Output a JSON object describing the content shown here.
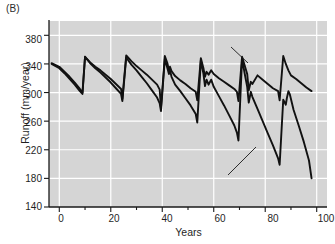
{
  "panel": {
    "label": "(B)"
  },
  "axes": {
    "xlabel": "Years",
    "ylabel": "Runoff (mm/year)",
    "xticks": [
      "0",
      "20",
      "40",
      "60",
      "80",
      "100"
    ],
    "yticks": [
      "380",
      "340",
      "300",
      "260",
      "220",
      "180",
      "140"
    ],
    "xlim": [
      -4,
      104
    ],
    "ylim": [
      140,
      400
    ],
    "grid": true,
    "plot_bg": "#d5d5d5",
    "grid_color": "#ffffff",
    "line_color": "#111111"
  },
  "annotations": [
    {
      "id": "native",
      "lines": [
        "Predicted runoff from",
        "native vegetation"
      ]
    },
    {
      "id": "invasive",
      "lines": [
        "Predicted runoff from",
        "vegetation dominated by",
        "invasive exotic species"
      ]
    }
  ],
  "chart_data": {
    "type": "line",
    "title": "",
    "xlabel": "Years",
    "ylabel": "Runoff (mm/year)",
    "xlim": [
      -4,
      104
    ],
    "ylim": [
      140,
      400
    ],
    "xticks": [
      0,
      20,
      40,
      60,
      80,
      100
    ],
    "yticks": [
      380,
      340,
      300,
      260,
      220,
      180,
      140
    ],
    "grid": true,
    "legend": "annotated-inline",
    "series": [
      {
        "name": "Predicted runoff from native vegetation",
        "color": "#111111",
        "points": [
          [
            -3,
            341
          ],
          [
            0,
            336
          ],
          [
            2,
            329
          ],
          [
            4,
            322
          ],
          [
            6,
            314
          ],
          [
            8,
            305
          ],
          [
            9,
            300
          ],
          [
            10,
            350
          ],
          [
            12,
            342
          ],
          [
            14,
            336
          ],
          [
            16,
            331
          ],
          [
            18,
            325
          ],
          [
            20,
            319
          ],
          [
            22,
            312
          ],
          [
            24,
            305
          ],
          [
            24.5,
            291
          ],
          [
            26,
            352
          ],
          [
            28,
            344
          ],
          [
            30,
            337
          ],
          [
            32,
            331
          ],
          [
            34,
            325
          ],
          [
            36,
            318
          ],
          [
            38,
            311
          ],
          [
            39,
            304
          ],
          [
            39.5,
            278
          ],
          [
            41,
            351
          ],
          [
            42,
            341
          ],
          [
            42.6,
            331
          ],
          [
            43,
            336
          ],
          [
            43.6,
            330
          ],
          [
            45,
            323
          ],
          [
            47,
            317
          ],
          [
            49,
            312
          ],
          [
            51,
            306
          ],
          [
            53,
            301
          ],
          [
            53.6,
            289
          ],
          [
            55,
            348
          ],
          [
            56,
            334
          ],
          [
            56.6,
            322
          ],
          [
            57.2,
            329
          ],
          [
            58,
            325
          ],
          [
            59,
            331
          ],
          [
            60,
            326
          ],
          [
            62,
            320
          ],
          [
            64,
            315
          ],
          [
            66,
            310
          ],
          [
            68,
            305
          ],
          [
            69,
            301
          ],
          [
            69.6,
            288
          ],
          [
            71,
            350
          ],
          [
            72,
            338
          ],
          [
            73,
            326
          ],
          [
            73.6,
            303
          ],
          [
            74.4,
            315
          ],
          [
            75,
            312
          ],
          [
            77,
            324
          ],
          [
            79,
            318
          ],
          [
            81,
            312
          ],
          [
            83,
            306
          ],
          [
            85,
            302
          ],
          [
            85.6,
            289
          ],
          [
            87,
            351
          ],
          [
            88,
            340
          ],
          [
            89,
            331
          ],
          [
            90,
            324
          ],
          [
            92,
            319
          ],
          [
            94,
            313
          ],
          [
            96,
            307
          ],
          [
            98,
            302
          ]
        ]
      },
      {
        "name": "Predicted runoff from vegetation dominated by invasive exotic species",
        "color": "#111111",
        "points": [
          [
            -3,
            340
          ],
          [
            0,
            334
          ],
          [
            2,
            327
          ],
          [
            4,
            319
          ],
          [
            6,
            311
          ],
          [
            8,
            302
          ],
          [
            9,
            298
          ],
          [
            10,
            350
          ],
          [
            12,
            341
          ],
          [
            14,
            334
          ],
          [
            16,
            328
          ],
          [
            18,
            321
          ],
          [
            20,
            314
          ],
          [
            22,
            306
          ],
          [
            24,
            298
          ],
          [
            24.5,
            288
          ],
          [
            26,
            349
          ],
          [
            28,
            339
          ],
          [
            30,
            331
          ],
          [
            32,
            322
          ],
          [
            34,
            313
          ],
          [
            36,
            303
          ],
          [
            38,
            293
          ],
          [
            39,
            285
          ],
          [
            39.5,
            274
          ],
          [
            41,
            347
          ],
          [
            42,
            334
          ],
          [
            42.6,
            326
          ],
          [
            43,
            331
          ],
          [
            43.6,
            322
          ],
          [
            45,
            311
          ],
          [
            47,
            302
          ],
          [
            49,
            292
          ],
          [
            51,
            282
          ],
          [
            53,
            270
          ],
          [
            53.6,
            258
          ],
          [
            55,
            345
          ],
          [
            56,
            326
          ],
          [
            56.6,
            309
          ],
          [
            57.2,
            318
          ],
          [
            58,
            311
          ],
          [
            59,
            318
          ],
          [
            60,
            308
          ],
          [
            62,
            295
          ],
          [
            64,
            282
          ],
          [
            66,
            268
          ],
          [
            68,
            254
          ],
          [
            69,
            244
          ],
          [
            69.6,
            233
          ],
          [
            71,
            347
          ],
          [
            72,
            327
          ],
          [
            73,
            308
          ],
          [
            73.6,
            286
          ],
          [
            74.4,
            301
          ],
          [
            75,
            294
          ],
          [
            77,
            277
          ],
          [
            79,
            260
          ],
          [
            81,
            243
          ],
          [
            83,
            226
          ],
          [
            85,
            208
          ],
          [
            85.6,
            199
          ],
          [
            87,
            290
          ],
          [
            88,
            283
          ],
          [
            88.4,
            292
          ],
          [
            89,
            302
          ],
          [
            89.6,
            297
          ],
          [
            91,
            276
          ],
          [
            93,
            254
          ],
          [
            95,
            231
          ],
          [
            97,
            205
          ],
          [
            98,
            180
          ]
        ]
      }
    ]
  }
}
